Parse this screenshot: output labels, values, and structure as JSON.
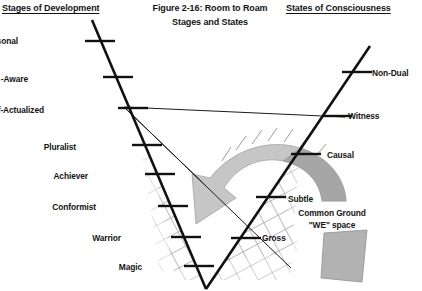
{
  "figure": {
    "title_line1": "Figure 2-16: Room to Roam",
    "title_line2": "Stages and States",
    "left_heading": "Stages of Development",
    "right_heading": "States of Consciousness",
    "common_ground_line1": "Common Ground",
    "common_ground_line2": "\"WE\" space"
  },
  "colors": {
    "line": "#111111",
    "thin_line": "#1a1a1a",
    "hatch": "#a8a8a8",
    "band_light": "#c9c9c9",
    "band_dark": "#a9a9a9",
    "box_fill": "#b5b5b5",
    "text": "#141414",
    "background": "#ffffff"
  },
  "stages": [
    {
      "label": "Trans-Personal",
      "label_x": 18,
      "label_y": 36,
      "tick_x": 100,
      "tick_y": 41
    },
    {
      "label": "Construct -Aware",
      "label_x": 28,
      "label_y": 74,
      "tick_x": 118,
      "tick_y": 77
    },
    {
      "label": "Self-Actualized",
      "label_x": 44,
      "label_y": 105,
      "tick_x": 133,
      "tick_y": 108
    },
    {
      "label": "Pluralist",
      "label_x": 76,
      "label_y": 142,
      "tick_x": 147,
      "tick_y": 145
    },
    {
      "label": "Achiever",
      "label_x": 88,
      "label_y": 171,
      "tick_x": 160,
      "tick_y": 174
    },
    {
      "label": "Conformist",
      "label_x": 96,
      "label_y": 202,
      "tick_x": 173,
      "tick_y": 206
    },
    {
      "label": "Warrior",
      "label_x": 121,
      "label_y": 233,
      "tick_x": 186,
      "tick_y": 237
    },
    {
      "label": "Magic",
      "label_x": 142,
      "label_y": 262,
      "tick_x": 199,
      "tick_y": 266
    }
  ],
  "states": [
    {
      "label": "Non-Dual",
      "label_x": 372,
      "label_y": 68,
      "tick_x": 357,
      "tick_y": 72
    },
    {
      "label": "Witness",
      "label_x": 348,
      "label_y": 111,
      "tick_x": 337,
      "tick_y": 116
    },
    {
      "label": "Causal",
      "label_x": 327,
      "label_y": 150,
      "tick_x": 306,
      "tick_y": 154
    },
    {
      "label": "Subtle",
      "label_x": 288,
      "label_y": 194,
      "tick_x": 271,
      "tick_y": 197
    },
    {
      "label": "Gross",
      "label_x": 262,
      "label_y": 233,
      "tick_x": 246,
      "tick_y": 238
    }
  ],
  "chart_data": {
    "type": "diagram",
    "axes": [
      {
        "name": "Stages of Development",
        "direction": "descending-right",
        "ticks": [
          "Trans-Personal",
          "Construct -Aware",
          "Self-Actualized",
          "Pluralist",
          "Achiever",
          "Conformist",
          "Warrior",
          "Magic"
        ]
      },
      {
        "name": "States of Consciousness",
        "direction": "ascending-right",
        "ticks": [
          "Non-Dual",
          "Witness",
          "Causal",
          "Subtle",
          "Gross"
        ]
      }
    ],
    "annotations": [
      "Common Ground",
      "\"WE\" space"
    ],
    "shapes": [
      "v-shaped axis pair",
      "curved gray arrow band",
      "crosshatched grid region",
      "gray quadrilateral block"
    ]
  }
}
